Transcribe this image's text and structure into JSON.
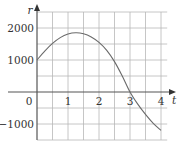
{
  "chart_data": {
    "type": "line",
    "title": "",
    "xlabel": "t",
    "ylabel": "r",
    "xlim": [
      0,
      4.5
    ],
    "ylim": [
      -1500,
      2500
    ],
    "grid": true,
    "x_ticks": [
      {
        "value": 0,
        "label": "0"
      },
      {
        "value": 1,
        "label": "1"
      },
      {
        "value": 2,
        "label": "2"
      },
      {
        "value": 3,
        "label": "3"
      },
      {
        "value": 4,
        "label": "4"
      }
    ],
    "y_ticks": [
      {
        "value": 2000,
        "label": "2000"
      },
      {
        "value": 1000,
        "label": "1000"
      },
      {
        "value": -1000,
        "label": "−1000"
      }
    ],
    "series": [
      {
        "name": "r(t)",
        "x": [
          0,
          0.25,
          0.5,
          0.75,
          1.0,
          1.25,
          1.5,
          1.75,
          2.0,
          2.25,
          2.5,
          2.75,
          3.0,
          3.25,
          3.5,
          3.75,
          4.0
        ],
        "y": [
          1000,
          1280,
          1520,
          1700,
          1810,
          1850,
          1820,
          1720,
          1550,
          1300,
          950,
          500,
          0,
          -380,
          -700,
          -980,
          -1200
        ]
      }
    ]
  }
}
